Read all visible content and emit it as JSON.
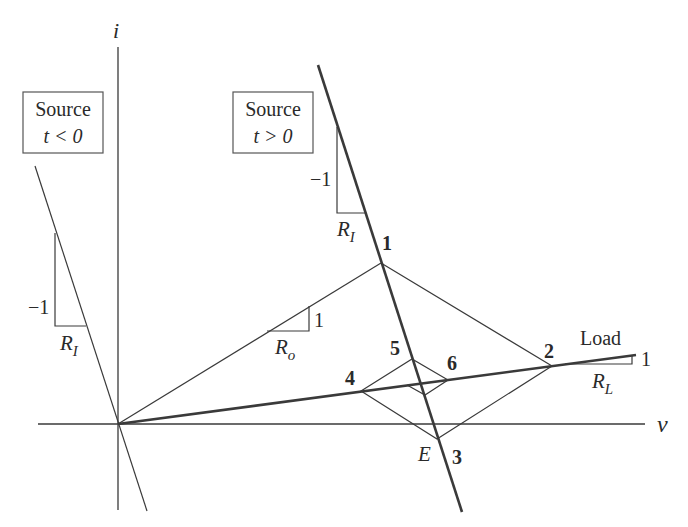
{
  "axes": {
    "vertical_label": "i",
    "horizontal_label": "v"
  },
  "source_neg": {
    "title": "Source",
    "condition": "t < 0",
    "slope_rise": "−1",
    "slope_run": "R",
    "slope_run_sub": "I"
  },
  "source_pos": {
    "title": "Source",
    "condition": "t > 0",
    "slope_rise": "−1",
    "slope_run": "R",
    "slope_run_sub": "I"
  },
  "line_ro": {
    "slope_rise": "1",
    "slope_run": "R",
    "slope_run_sub": "o"
  },
  "load": {
    "label": "Load",
    "slope_rise": "1",
    "slope_run": "R",
    "slope_run_sub": "L"
  },
  "points": [
    {
      "label": "1"
    },
    {
      "label": "2"
    },
    {
      "label": "3"
    },
    {
      "label": "4"
    },
    {
      "label": "5"
    },
    {
      "label": "6"
    }
  ],
  "equilibrium_label": "E"
}
